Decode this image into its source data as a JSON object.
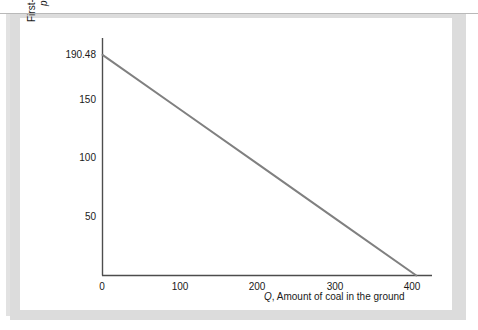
{
  "chart_data": {
    "type": "line",
    "title": "",
    "xlabel": "Q, Amount of coal in the ground",
    "xlabel_symbol": "Q",
    "xlabel_rest": ", Amount of coal in the ground",
    "ylabel_line1": "First-year price of coal,",
    "ylabel_symbol": "p",
    "ylabel_subscript": "1",
    "ylabel_rest": ", $ per pound",
    "ylabel_full": "First-year price of coal, p1, $ per pound",
    "xlim": [
      0,
      420
    ],
    "ylim": [
      0,
      205
    ],
    "xticks": [
      0,
      100,
      200,
      300,
      400
    ],
    "xtick_labels": [
      "0",
      "100",
      "200",
      "300",
      "400"
    ],
    "yticks": [
      50,
      100,
      150,
      190.48
    ],
    "ytick_labels": [
      "50",
      "100",
      "150",
      "190.48"
    ],
    "grid": false,
    "legend": "none",
    "series": [
      {
        "name": "First-year demand for coal",
        "color": "#808080",
        "linewidth": 2,
        "points": [
          {
            "x": 0,
            "y": 190.48
          },
          {
            "x": 100,
            "y": 142.86
          },
          {
            "x": 200,
            "y": 95.24
          },
          {
            "x": 300,
            "y": 47.62
          },
          {
            "x": 400,
            "y": 0
          }
        ],
        "intercept": 190.48,
        "x_intercept": 400
      }
    ],
    "annotations": []
  },
  "figure": {
    "axis_color": "#4d4d4d",
    "line_color": "#808080",
    "panel_background": "#ffffff",
    "surround_color": "#dcdcdc",
    "rule_color": "#b9b9b9"
  }
}
